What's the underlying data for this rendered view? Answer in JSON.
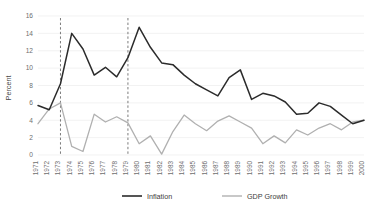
{
  "chart_data": {
    "type": "line",
    "title": "",
    "xlabel": "",
    "ylabel": "Percent",
    "ylim": [
      0,
      16
    ],
    "yticks": [
      0,
      2,
      4,
      6,
      8,
      10,
      12,
      14,
      16
    ],
    "grid": true,
    "legend_position": "bottom",
    "x": [
      1971,
      1972,
      1973,
      1974,
      1975,
      1976,
      1977,
      1978,
      1979,
      1980,
      1981,
      1982,
      1983,
      1984,
      1985,
      1986,
      1987,
      1988,
      1989,
      1990,
      1991,
      1992,
      1993,
      1994,
      1995,
      1996,
      1997,
      1998,
      1999,
      2000
    ],
    "categories": [
      "1971",
      "1972",
      "1973",
      "1974",
      "1975",
      "1976",
      "1977",
      "1978",
      "1979",
      "1980",
      "1981",
      "1982",
      "1983",
      "1984",
      "1985",
      "1986",
      "1987",
      "1988",
      "1989",
      "1990",
      "1991",
      "1992",
      "1993",
      "1994",
      "1995",
      "1996",
      "1997",
      "1998",
      "1999",
      "2000"
    ],
    "series": [
      {
        "name": "Inflation",
        "color": "#2b2b2b",
        "values": [
          5.7,
          5.2,
          8.2,
          14.0,
          12.2,
          9.2,
          10.1,
          9.0,
          11.2,
          14.7,
          12.4,
          10.6,
          10.4,
          9.2,
          8.2,
          7.5,
          6.8,
          8.9,
          9.8,
          6.4,
          7.1,
          6.8,
          6.1,
          4.7,
          4.8,
          6.0,
          5.6,
          4.6,
          3.6,
          4.0
        ]
      },
      {
        "name": "GDP Growth",
        "color": "#b0b0b0",
        "values": [
          3.6,
          5.3,
          6.0,
          1.0,
          0.4,
          4.7,
          3.8,
          4.4,
          3.7,
          1.3,
          2.2,
          0.1,
          2.7,
          4.6,
          3.6,
          2.8,
          3.9,
          4.5,
          3.8,
          3.1,
          1.3,
          2.2,
          1.4,
          2.9,
          2.3,
          3.1,
          3.6,
          2.9,
          3.8,
          4.0
        ]
      }
    ],
    "event_lines": [
      {
        "label": "1973",
        "x": 1973
      },
      {
        "label": "1979",
        "x": 1979
      }
    ],
    "legend": [
      {
        "label": "Inflation",
        "color": "#2b2b2b"
      },
      {
        "label": "GDP Growth",
        "color": "#b0b0b0"
      }
    ]
  }
}
